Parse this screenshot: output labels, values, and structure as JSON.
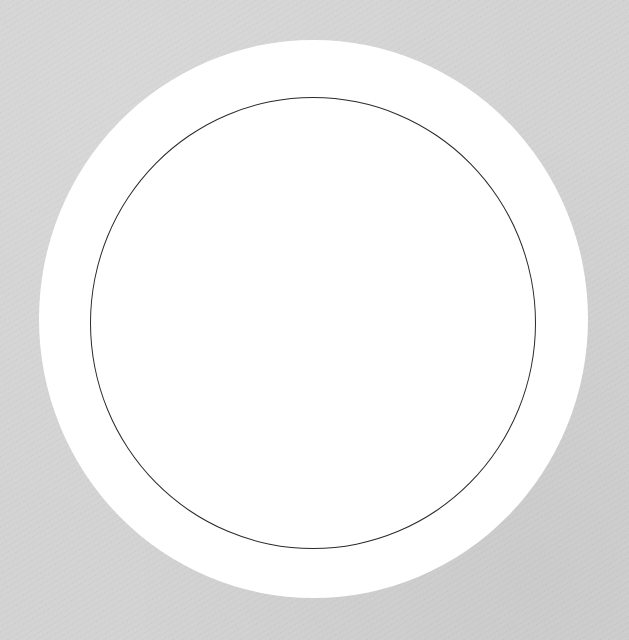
{
  "scene": {
    "description": "Gray textured paper with a large white disk and a thin dark circle outline drawn inside it",
    "colors": {
      "background": "#d3d3d3",
      "disk_fill": "#ffffff",
      "circle_stroke": "#2a2a2a"
    },
    "shapes": [
      {
        "name": "outer-disk",
        "type": "ellipse",
        "cx": 313.5,
        "cy": 319,
        "rx": 274.5,
        "ry": 279,
        "fill": "#ffffff"
      },
      {
        "name": "inner-circle",
        "type": "ellipse-outline",
        "cx": 313,
        "cy": 323,
        "rx": 223,
        "ry": 226,
        "stroke": "#2a2a2a",
        "stroke_width": 1.6
      }
    ]
  }
}
